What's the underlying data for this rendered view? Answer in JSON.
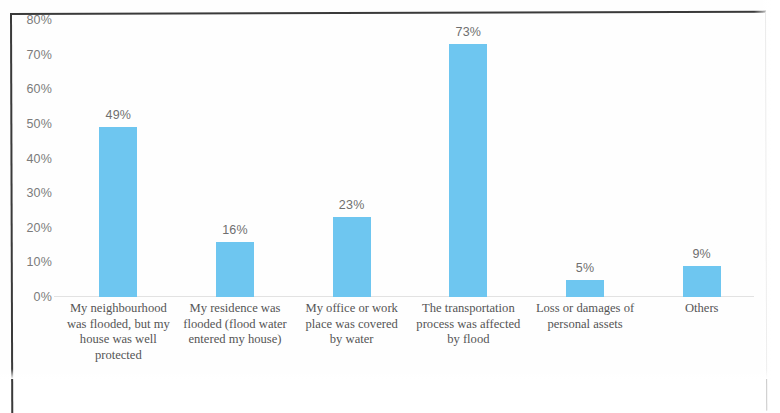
{
  "chart_data": {
    "type": "bar",
    "title": "",
    "xlabel": "",
    "ylabel": "",
    "ylim": [
      0,
      80
    ],
    "grid": false,
    "legend": "none",
    "categories": [
      "My neighbourhood was flooded, but my house was well protected",
      "My residence was flooded (flood water entered my house)",
      "My office or work place was covered by water",
      "The transportation process was affected by flood",
      "Loss or damages of personal assets",
      "Others"
    ],
    "values": [
      49,
      16,
      23,
      73,
      5,
      9
    ],
    "value_labels": [
      "49%",
      "16%",
      "23%",
      "73%",
      "5%",
      "9%"
    ],
    "ytick_labels": [
      "80%",
      "70%",
      "60%",
      "50%",
      "40%",
      "30%",
      "20%",
      "10%",
      "0%"
    ],
    "ytick_values": [
      80,
      70,
      60,
      50,
      40,
      30,
      20,
      10,
      0
    ],
    "bar_color": "#6ec6f0",
    "label_color": "#6f6f6f",
    "axis_color": "#7b7b7b",
    "category_lines": [
      [
        "My neighbourhood",
        "was flooded, but my",
        "house was well",
        "protected"
      ],
      [
        "My residence was",
        "flooded (flood water",
        "entered my house)"
      ],
      [
        "My office or work",
        "place was covered",
        "by water"
      ],
      [
        "The transportation",
        "process was affected",
        "by flood"
      ],
      [
        "Loss or damages of",
        "personal assets"
      ],
      [
        "Others"
      ]
    ]
  }
}
